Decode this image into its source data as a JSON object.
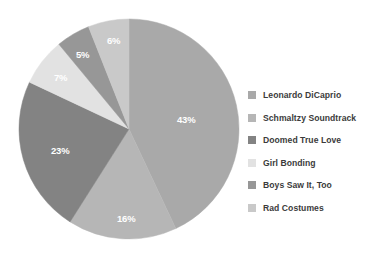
{
  "chart_data": {
    "type": "pie",
    "title": "",
    "subtitle": "",
    "xlabel": "",
    "ylabel": "",
    "grid": false,
    "legend_position": "right",
    "start_angle_deg": 0,
    "direction": "clockwise",
    "categories": [
      "Leonardo DiCaprio",
      "Schmaltzy Soundtrack",
      "Doomed True Love",
      "Girl Bonding",
      "Boys Saw It, Too",
      "Rad Costumes"
    ],
    "values": [
      43,
      16,
      23,
      7,
      5,
      6
    ],
    "value_labels": [
      "43%",
      "16%",
      "23%",
      "7%",
      "5%",
      "6%"
    ],
    "colors": [
      "#a9a9a9",
      "#b6b6b6",
      "#838383",
      "#e2e2e2",
      "#979797",
      "#c9c9c9"
    ],
    "slices": [
      {
        "name": "Leonardo DiCaprio",
        "value": 43,
        "label": "43%",
        "color": "#a9a9a9",
        "start_deg": 0,
        "end_deg": 154.8,
        "label_x": 159,
        "label_y": 115
      },
      {
        "name": "Schmaltzy Soundtrack",
        "value": 16,
        "label": "16%",
        "color": "#b6b6b6",
        "start_deg": 154.8,
        "end_deg": 212.4,
        "label_x": 99,
        "label_y": 214
      },
      {
        "name": "Doomed True Love",
        "value": 23,
        "label": "23%",
        "color": "#838383",
        "start_deg": 212.4,
        "end_deg": 295.2,
        "label_x": 33,
        "label_y": 146
      },
      {
        "name": "Girl Bonding",
        "value": 7,
        "label": "7%",
        "color": "#e2e2e2",
        "start_deg": 295.2,
        "end_deg": 320.4,
        "label_x": 36,
        "label_y": 73
      },
      {
        "name": "Boys Saw It, Too",
        "value": 5,
        "label": "5%",
        "color": "#979797",
        "start_deg": 320.4,
        "end_deg": 338.4,
        "label_x": 58,
        "label_y": 50
      },
      {
        "name": "Rad Costumes",
        "value": 6,
        "label": "6%",
        "color": "#c9c9c9",
        "start_deg": 338.4,
        "end_deg": 360,
        "label_x": 89,
        "label_y": 36
      }
    ]
  },
  "legend": {
    "items": [
      {
        "label": "Leonardo DiCaprio",
        "color": "#a9a9a9"
      },
      {
        "label": "Schmaltzy Soundtrack",
        "color": "#b6b6b6"
      },
      {
        "label": "Doomed True Love",
        "color": "#838383"
      },
      {
        "label": "Girl Bonding",
        "color": "#e2e2e2"
      },
      {
        "label": "Boys Saw It, Too",
        "color": "#979797"
      },
      {
        "label": "Rad Costumes",
        "color": "#c9c9c9"
      }
    ]
  }
}
